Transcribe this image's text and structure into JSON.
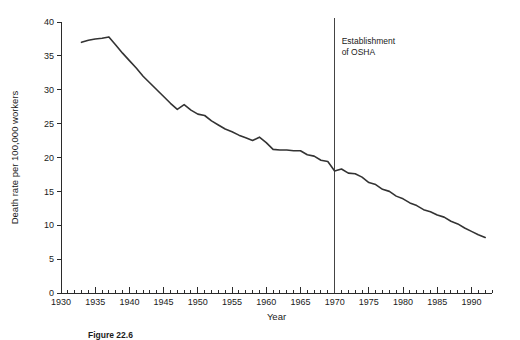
{
  "figure": {
    "caption": "Figure 22.6",
    "annotation_line1": "Establishment",
    "annotation_line2": "of OSHA"
  },
  "chart_data": {
    "type": "line",
    "title": "",
    "xlabel": "Year",
    "ylabel": "Death rate per 100,000 workers",
    "xlim": [
      1930,
      1993
    ],
    "ylim": [
      0,
      40
    ],
    "grid": false,
    "legend": null,
    "y_ticks": [
      0,
      5,
      10,
      15,
      20,
      25,
      30,
      35,
      40
    ],
    "y_tick_labels": [
      "0",
      "5",
      "10",
      "15",
      "20",
      "25",
      "30",
      "35",
      "40"
    ],
    "y_minor_tick_step": 0,
    "x_ticks": [
      1930,
      1935,
      1940,
      1945,
      1950,
      1955,
      1960,
      1965,
      1970,
      1975,
      1980,
      1985,
      1990
    ],
    "x_tick_labels": [
      "1930",
      "1935",
      "1940",
      "1945",
      "1950",
      "1955",
      "1960",
      "1965",
      "1970",
      "1975",
      "1980",
      "1985",
      "1990"
    ],
    "x_minor_tick_step": 1,
    "line_color": "#333333",
    "annotations": [
      {
        "name": "osha-marker",
        "type": "vline",
        "x": 1970,
        "label": "Establishment of OSHA",
        "color": "#444444"
      }
    ],
    "x": [
      1933,
      1934,
      1935,
      1936,
      1937,
      1938,
      1939,
      1940,
      1941,
      1942,
      1943,
      1944,
      1945,
      1946,
      1947,
      1948,
      1949,
      1950,
      1951,
      1952,
      1953,
      1954,
      1955,
      1956,
      1957,
      1958,
      1959,
      1960,
      1961,
      1962,
      1963,
      1964,
      1965,
      1966,
      1967,
      1968,
      1969,
      1970,
      1971,
      1972,
      1973,
      1974,
      1975,
      1976,
      1977,
      1978,
      1979,
      1980,
      1981,
      1982,
      1983,
      1984,
      1985,
      1986,
      1987,
      1988,
      1989,
      1990,
      1991,
      1992
    ],
    "values": [
      37.0,
      37.3,
      37.5,
      37.6,
      37.8,
      36.6,
      35.4,
      34.3,
      33.2,
      32.0,
      31.0,
      30.0,
      29.0,
      28.0,
      27.1,
      27.8,
      27.0,
      26.4,
      26.2,
      25.4,
      24.8,
      24.2,
      23.8,
      23.3,
      22.9,
      22.5,
      23.0,
      22.2,
      21.2,
      21.1,
      21.1,
      21.0,
      21.0,
      20.4,
      20.2,
      19.6,
      19.4,
      18.0,
      18.3,
      17.7,
      17.6,
      17.1,
      16.3,
      16.0,
      15.3,
      15.0,
      14.3,
      13.9,
      13.3,
      12.9,
      12.3,
      12.0,
      11.5,
      11.2,
      10.6,
      10.2,
      9.6,
      9.1,
      8.6,
      8.2
    ]
  }
}
